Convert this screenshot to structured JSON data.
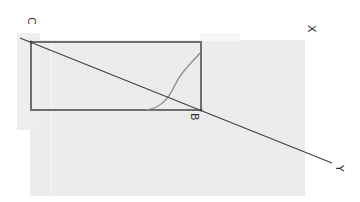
{
  "diagram": {
    "labels": {
      "c": "C",
      "b": "B",
      "x": "X",
      "y": "Y"
    },
    "colors": {
      "background": "#ffffff",
      "panel": "#ececec",
      "panel_light": "#f2f2f2",
      "rectangle": "#6e6e6e",
      "line": "#444444",
      "curve": "#8a8a8a",
      "label": "#333333"
    },
    "elements": [
      {
        "type": "rectangle",
        "name": "rectangle",
        "corners": [
          "C",
          "B"
        ]
      },
      {
        "type": "line",
        "name": "line-CY",
        "through": [
          "C",
          "B",
          "Y"
        ]
      },
      {
        "type": "curve",
        "name": "s-curve",
        "inside": "rectangle"
      }
    ],
    "orientation": "rotated 90 degrees clockwise"
  }
}
